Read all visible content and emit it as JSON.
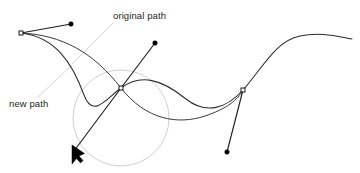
{
  "figure": {
    "background_color": "#ffffff",
    "width": 360,
    "height": 173
  },
  "labels": {
    "original_path": "original path",
    "new_path": "new path"
  },
  "colors": {
    "path_stroke": "#2b2b2b",
    "original_path_stroke": "#3a3a3a",
    "guide_circle": "#c9c9c9",
    "leader_line": "#cfcfcf",
    "anchor_fill": "#ffffff",
    "anchor_stroke": "#000000",
    "handle_dot": "#000000",
    "cursor": "#000000",
    "text": "#231f20"
  },
  "geometry": {
    "new_path_d": "M 21,33 C 55,37 72,62 84,95 C 93,119 106,99 121,88 C 140,74 160,78 186,99 C 205,114 225,110 243,90 C 262,69 275,41 300,36 C 320,32 335,36 352,39",
    "original_path_d": "M 21,33 C 62,35 93,52 121,88 C 146,120 178,125 205,116 C 226,109 238,100 243,90",
    "guide_circle": {
      "cx": 121,
      "cy": 118,
      "r": 48
    },
    "handles": [
      {
        "name": "left-anchor-handle",
        "x1": 21,
        "y1": 33,
        "x2": 71,
        "y2": 24
      },
      {
        "name": "center-upper-handle",
        "x1": 121,
        "y1": 88,
        "x2": 155,
        "y2": 43
      },
      {
        "name": "center-lower-handle",
        "x1": 121,
        "y1": 88,
        "x2": 73,
        "y2": 152
      },
      {
        "name": "right-anchor-handle",
        "x1": 243,
        "y1": 90,
        "x2": 227,
        "y2": 152
      }
    ],
    "handle_dots": [
      {
        "name": "left-handle-dot",
        "cx": 71,
        "cy": 24,
        "r": 2.3
      },
      {
        "name": "upper-handle-dot",
        "cx": 155,
        "cy": 43,
        "r": 2.3
      },
      {
        "name": "lower-right-handle-dot",
        "cx": 227,
        "cy": 152,
        "r": 2.3
      }
    ],
    "anchors": [
      {
        "name": "left-anchor-point",
        "x": 21,
        "y": 33,
        "size": 4
      },
      {
        "name": "center-anchor-point",
        "x": 121,
        "y": 88,
        "size": 4
      },
      {
        "name": "right-anchor-point",
        "x": 243,
        "y": 90,
        "size": 4
      }
    ],
    "cursor": {
      "name": "drag-cursor",
      "points": "73,146 73,164 77,158 81,162 83,159 79,155 84,153"
    },
    "leaders": [
      {
        "name": "original-path-leader",
        "x1": 113,
        "y1": 23,
        "x2": 72,
        "y2": 64
      },
      {
        "name": "new-path-leader",
        "x1": 38,
        "y1": 97,
        "x2": 72,
        "y2": 65
      }
    ],
    "label_positions": {
      "original_path": {
        "x": 113,
        "y": 19
      },
      "new_path": {
        "x": 9,
        "y": 107
      }
    }
  }
}
